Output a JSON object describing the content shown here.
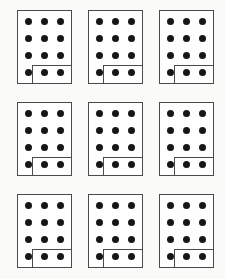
{
  "figure": {
    "kind": "dot-card-grid",
    "grid_rows": 3,
    "grid_cols": 3,
    "cards": [
      {
        "dot_rows": 4,
        "dot_cols": 3,
        "total_dots": 12,
        "boxed_dots": 2,
        "boxed_location": "bottom-right"
      },
      {
        "dot_rows": 4,
        "dot_cols": 3,
        "total_dots": 12,
        "boxed_dots": 2,
        "boxed_location": "bottom-right"
      },
      {
        "dot_rows": 4,
        "dot_cols": 3,
        "total_dots": 12,
        "boxed_dots": 2,
        "boxed_location": "bottom-right"
      },
      {
        "dot_rows": 4,
        "dot_cols": 3,
        "total_dots": 12,
        "boxed_dots": 2,
        "boxed_location": "bottom-right"
      },
      {
        "dot_rows": 4,
        "dot_cols": 3,
        "total_dots": 12,
        "boxed_dots": 2,
        "boxed_location": "bottom-right"
      },
      {
        "dot_rows": 4,
        "dot_cols": 3,
        "total_dots": 12,
        "boxed_dots": 2,
        "boxed_location": "bottom-right"
      },
      {
        "dot_rows": 4,
        "dot_cols": 3,
        "total_dots": 12,
        "boxed_dots": 2,
        "boxed_location": "bottom-right"
      },
      {
        "dot_rows": 4,
        "dot_cols": 3,
        "total_dots": 12,
        "boxed_dots": 2,
        "boxed_location": "bottom-right"
      },
      {
        "dot_rows": 4,
        "dot_cols": 3,
        "total_dots": 12,
        "boxed_dots": 2,
        "boxed_location": "bottom-right"
      }
    ]
  },
  "colors": {
    "background": "#fafaf8",
    "card_background": "#fefefe",
    "border": "#4a4a4a",
    "dot": "#161616"
  }
}
